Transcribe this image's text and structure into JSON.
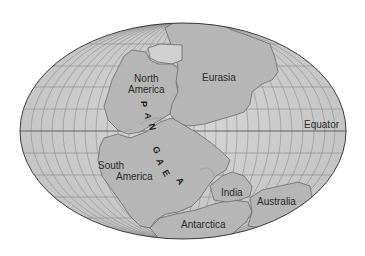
{
  "map": {
    "title": "Pangaea",
    "projection": "elliptical (Mollweide-like) world map",
    "colors": {
      "ocean": "#c9c9c9",
      "land": "#b4b4b4",
      "land_light": "#d4d4d4",
      "grid": "#8a8a8a",
      "outline": "#3a3a3a",
      "coast": "#6e6e6e",
      "text": "#2a2a2a"
    },
    "labels": {
      "north_america_1": "North",
      "north_america_2": "America",
      "eurasia": "Eurasia",
      "south_america_1": "South",
      "south_america_2": "America",
      "india": "India",
      "australia": "Australia",
      "antarctica": "Antarctica",
      "equator": "Equator"
    },
    "supercontinent_letters": [
      "P",
      "A",
      "N",
      "G",
      "A",
      "E",
      "A"
    ]
  }
}
